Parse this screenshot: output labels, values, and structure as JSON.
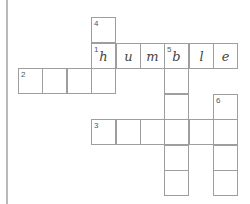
{
  "puzzle": {
    "type": "crossword",
    "origin": {
      "x": 18,
      "y": 17
    },
    "cell_w": 24.4,
    "cell_h": 25.5,
    "cells": [
      {
        "r": 0,
        "c": 3,
        "num": "4",
        "letter": ""
      },
      {
        "r": 1,
        "c": 3,
        "num": "1",
        "letter": "h"
      },
      {
        "r": 1,
        "c": 4,
        "num": "",
        "letter": "u"
      },
      {
        "r": 1,
        "c": 5,
        "num": "",
        "letter": "m"
      },
      {
        "r": 1,
        "c": 6,
        "num": "5",
        "letter": "b"
      },
      {
        "r": 1,
        "c": 7,
        "num": "",
        "letter": "l"
      },
      {
        "r": 1,
        "c": 8,
        "num": "",
        "letter": "e"
      },
      {
        "r": 2,
        "c": 0,
        "num": "2",
        "letter": ""
      },
      {
        "r": 2,
        "c": 1,
        "num": "",
        "letter": ""
      },
      {
        "r": 2,
        "c": 2,
        "num": "",
        "letter": ""
      },
      {
        "r": 2,
        "c": 3,
        "num": "",
        "letter": ""
      },
      {
        "r": 2,
        "c": 6,
        "num": "",
        "letter": ""
      },
      {
        "r": 3,
        "c": 6,
        "num": "",
        "letter": ""
      },
      {
        "r": 3,
        "c": 8,
        "num": "6",
        "letter": ""
      },
      {
        "r": 4,
        "c": 3,
        "num": "3",
        "letter": ""
      },
      {
        "r": 4,
        "c": 4,
        "num": "",
        "letter": ""
      },
      {
        "r": 4,
        "c": 5,
        "num": "",
        "letter": ""
      },
      {
        "r": 4,
        "c": 6,
        "num": "",
        "letter": ""
      },
      {
        "r": 4,
        "c": 7,
        "num": "",
        "letter": ""
      },
      {
        "r": 4,
        "c": 8,
        "num": "",
        "letter": ""
      },
      {
        "r": 5,
        "c": 6,
        "num": "",
        "letter": ""
      },
      {
        "r": 5,
        "c": 8,
        "num": "",
        "letter": ""
      },
      {
        "r": 6,
        "c": 6,
        "num": "",
        "letter": ""
      },
      {
        "r": 6,
        "c": 8,
        "num": "",
        "letter": ""
      }
    ],
    "filled_word": "humble"
  }
}
